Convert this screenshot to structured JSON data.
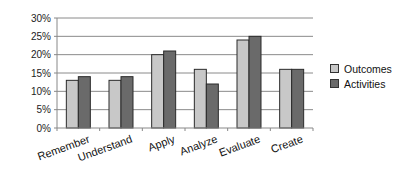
{
  "chart_data": {
    "type": "bar",
    "title": "",
    "xlabel": "",
    "ylabel": "",
    "ylim": [
      0,
      30
    ],
    "yticks": [
      "0%",
      "5%",
      "10%",
      "15%",
      "20%",
      "25%",
      "30%"
    ],
    "grid": true,
    "legend_position": "right",
    "categories": [
      "Remember",
      "Understand",
      "Apply",
      "Analyze",
      "Evaluate",
      "Create"
    ],
    "series": [
      {
        "name": "Outcomes",
        "color": "#c8c8c8",
        "values": [
          13,
          13,
          20,
          16,
          24,
          16
        ]
      },
      {
        "name": "Activities",
        "color": "#6a6a6a",
        "values": [
          14,
          14,
          21,
          12,
          25,
          16
        ]
      }
    ]
  },
  "legend": {
    "items": [
      {
        "label": "Outcomes",
        "color": "#c8c8c8"
      },
      {
        "label": "Activities",
        "color": "#6a6a6a"
      }
    ]
  }
}
